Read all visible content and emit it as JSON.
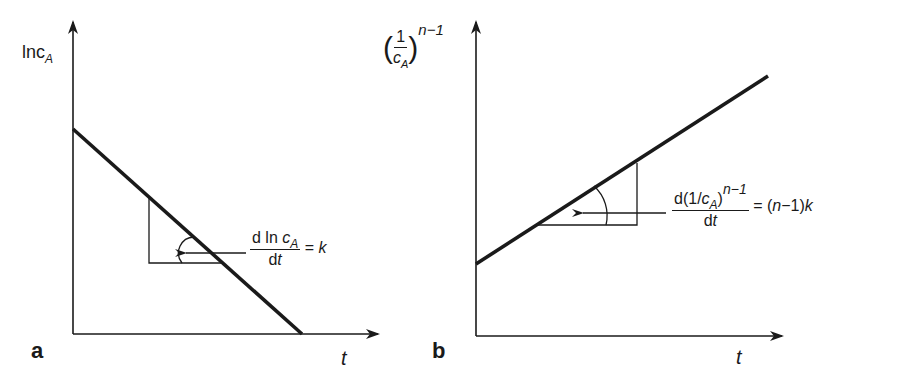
{
  "figure": {
    "colors": {
      "ink": "#1a1a1a",
      "background": "#ffffff"
    },
    "panels": [
      {
        "id": "a",
        "panel_label": "a",
        "y_axis_label": {
          "base": "lnc",
          "subscript": "A"
        },
        "x_axis_label": "t",
        "line": {
          "direction": "decreasing",
          "start": [
            73,
            129
          ],
          "end": [
            302,
            334
          ]
        },
        "slope_annotation": {
          "numerator": {
            "prefix": "d ln ",
            "var": "c",
            "subscript": "A"
          },
          "denominator": {
            "d": "d",
            "var": "t"
          },
          "equals": "= ",
          "result": "k"
        }
      },
      {
        "id": "b",
        "panel_label": "b",
        "y_axis_label": {
          "paren_open": "(",
          "numerator": "1",
          "denominator_var": "c",
          "denominator_sub": "A",
          "paren_close": ")",
          "exponent": "n−1"
        },
        "x_axis_label": "t",
        "line": {
          "direction": "increasing",
          "start": [
            476,
            264
          ],
          "end": [
            768,
            76
          ]
        },
        "slope_annotation": {
          "numerator": {
            "prefix": "d(1/",
            "var": "c",
            "subscript": "A",
            "close": ")",
            "exponent": "n−1"
          },
          "denominator": {
            "d": "d",
            "var": "t"
          },
          "equals": "= (",
          "result_var": "n",
          "result_mid": "−1)",
          "result": "k"
        }
      }
    ]
  }
}
